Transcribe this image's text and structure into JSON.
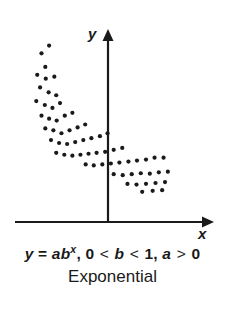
{
  "figure": {
    "background_color": "#ffffff",
    "ink_color": "#1a1a1a"
  },
  "axes": {
    "y_label": "y",
    "x_label": "x",
    "y_axis_name": "y-axis",
    "x_axis_name": "x-axis",
    "arrowheads": true
  },
  "caption": {
    "equation_parts": {
      "y": "y",
      "equals": " = ",
      "a": "a",
      "b": "b",
      "exponent": "x",
      "comma1": ", ",
      "zero": "0",
      "lt1": " < ",
      "b2": "b",
      "lt2": " < ",
      "one": "1",
      "comma2": ", ",
      "a2": "a",
      "gt": " > ",
      "zero2": "0"
    },
    "equation_plain": "y = ab^x, 0 < b < 1, a > 0",
    "title": "Exponential"
  },
  "chart_data": {
    "type": "scatter",
    "title": "Exponential",
    "annotations": [
      "y = ab^x, 0 < b < 1, a > 0"
    ],
    "xlabel": "x",
    "ylabel": "y",
    "grid": false,
    "legend": false,
    "axis_style": "arrowed-cartesian-axes-no-ticks",
    "xlim": [
      -1.0,
      1.0
    ],
    "ylim": [
      0.0,
      1.0
    ],
    "points": [
      [
        -0.62,
        0.905
      ],
      [
        -0.7,
        0.865
      ],
      [
        -0.66,
        0.795
      ],
      [
        -0.745,
        0.755
      ],
      [
        -0.655,
        0.735
      ],
      [
        -0.565,
        0.745
      ],
      [
        -0.715,
        0.69
      ],
      [
        -0.625,
        0.665
      ],
      [
        -0.545,
        0.65
      ],
      [
        -0.755,
        0.62
      ],
      [
        -0.665,
        0.6
      ],
      [
        -0.585,
        0.585
      ],
      [
        -0.505,
        0.61
      ],
      [
        -0.7,
        0.545
      ],
      [
        -0.62,
        0.53
      ],
      [
        -0.54,
        0.52
      ],
      [
        -0.455,
        0.545
      ],
      [
        -0.375,
        0.56
      ],
      [
        -0.66,
        0.48
      ],
      [
        -0.575,
        0.47
      ],
      [
        -0.49,
        0.455
      ],
      [
        -0.405,
        0.47
      ],
      [
        -0.32,
        0.485
      ],
      [
        -0.24,
        0.5
      ],
      [
        -0.6,
        0.42
      ],
      [
        -0.515,
        0.405
      ],
      [
        -0.43,
        0.4
      ],
      [
        -0.345,
        0.41
      ],
      [
        -0.26,
        0.42
      ],
      [
        -0.175,
        0.43
      ],
      [
        -0.085,
        0.44
      ],
      [
        -0.005,
        0.455
      ],
      [
        -0.545,
        0.355
      ],
      [
        -0.46,
        0.345
      ],
      [
        -0.375,
        0.34
      ],
      [
        -0.29,
        0.345
      ],
      [
        -0.205,
        0.35
      ],
      [
        -0.12,
        0.355
      ],
      [
        -0.03,
        0.36
      ],
      [
        0.06,
        0.37
      ],
      [
        0.15,
        0.38
      ],
      [
        -0.235,
        0.295
      ],
      [
        -0.15,
        0.29
      ],
      [
        -0.06,
        0.295
      ],
      [
        0.03,
        0.3
      ],
      [
        0.12,
        0.305
      ],
      [
        0.215,
        0.31
      ],
      [
        0.305,
        0.315
      ],
      [
        0.4,
        0.32
      ],
      [
        0.49,
        0.33
      ],
      [
        0.585,
        0.33
      ],
      [
        0.06,
        0.245
      ],
      [
        0.155,
        0.24
      ],
      [
        0.25,
        0.245
      ],
      [
        0.345,
        0.25
      ],
      [
        0.44,
        0.248
      ],
      [
        0.535,
        0.255
      ],
      [
        0.63,
        0.258
      ],
      [
        0.205,
        0.195
      ],
      [
        0.3,
        0.192
      ],
      [
        0.4,
        0.196
      ],
      [
        0.5,
        0.2
      ],
      [
        0.6,
        0.205
      ],
      [
        0.36,
        0.155
      ],
      [
        0.47,
        0.16
      ],
      [
        0.57,
        0.163
      ]
    ]
  }
}
